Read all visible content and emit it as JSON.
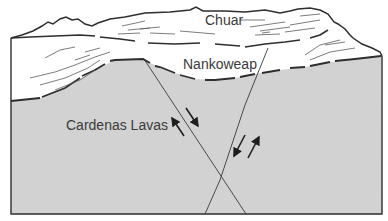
{
  "diagram": {
    "type": "geologic-cross-section",
    "colors": {
      "lava_fill": "#d2d2d2",
      "line": "#2e2e2e",
      "background": "#ffffff"
    },
    "units": [
      {
        "name": "Chuar",
        "position": "top"
      },
      {
        "name": "Nankoweap",
        "position": "middle"
      },
      {
        "name": "Cardenas Lavas",
        "position": "bottom"
      }
    ],
    "faults": [
      {
        "name": "left-fault",
        "orientation": "dips-right",
        "sense": "normal"
      },
      {
        "name": "right-fault",
        "orientation": "dips-left",
        "sense": "reverse"
      }
    ]
  }
}
